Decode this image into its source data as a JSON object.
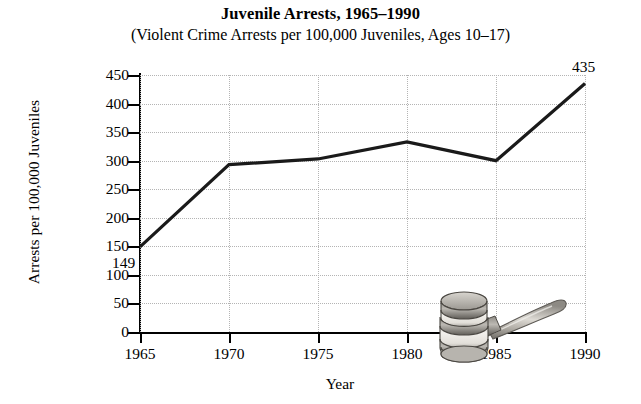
{
  "chart_data": {
    "type": "line",
    "title": "Juvenile Arrests, 1965–1990",
    "subtitle": "(Violent Crime Arrests per 100,000 Juveniles, Ages 10–17)",
    "xlabel": "Year",
    "ylabel": "Arrests per 100,000 Juveniles",
    "categories": [
      1965,
      1970,
      1975,
      1980,
      1985,
      1990
    ],
    "x_ticklabels": [
      "1965",
      "1970",
      "1975",
      "1980",
      "1985",
      "1990"
    ],
    "values": [
      149,
      293,
      303,
      333,
      300,
      435
    ],
    "xlim": [
      1965,
      1990
    ],
    "ylim": [
      0,
      450
    ],
    "y_ticks": [
      0,
      50,
      100,
      150,
      200,
      250,
      300,
      350,
      400,
      450
    ],
    "y_ticklabels": [
      "0",
      "50",
      "100",
      "150",
      "200",
      "250",
      "300",
      "350",
      "400",
      "450"
    ],
    "grid": true,
    "legend": false,
    "annotations": [
      {
        "text": "149",
        "year": 1965,
        "value": 149
      },
      {
        "text": "435",
        "year": 1990,
        "value": 435
      }
    ],
    "line_color": "#1a1a1a",
    "grid_color": "#b4b4b4",
    "axis_color": "#000000"
  },
  "decoration": {
    "gavel_label": "gavel-illustration",
    "gavel_light": "#e8e6e2",
    "gavel_mid": "#a8a49e",
    "gavel_dark": "#4e4b46"
  }
}
